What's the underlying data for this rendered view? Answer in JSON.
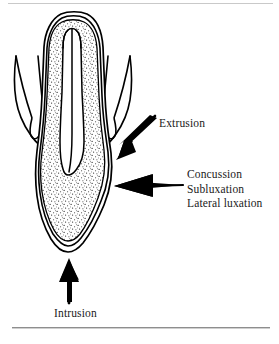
{
  "figure": {
    "orientation": "inverted-root-up-crown-down",
    "structures": [
      {
        "name": "root",
        "fill": "stippled-dentin"
      },
      {
        "name": "pulp-canal",
        "fill": "white"
      },
      {
        "name": "enamel-outline",
        "fill": "white"
      },
      {
        "name": "gingiva",
        "fill": "white"
      },
      {
        "name": "periodontal-ligament",
        "fill": "white"
      }
    ],
    "colors": {
      "ink": "#000000",
      "paper": "#ffffff",
      "stipple": "#333333",
      "rule": "#8e8e8e"
    }
  },
  "labels": {
    "extrusion": "Extrusion",
    "concussion": "Concussion",
    "subluxation": "Subluxation",
    "lateral_luxation": "Lateral luxation",
    "intrusion": "Intrusion"
  },
  "arrows": [
    {
      "name": "extrusion-arrow",
      "direction": "down-left",
      "points_to": "cervical-region",
      "label": "Extrusion"
    },
    {
      "name": "lateral-arrow",
      "direction": "left",
      "points_to": "crown-mid-facial",
      "label": "Concussion / Subluxation / Lateral luxation"
    },
    {
      "name": "intrusion-arrow",
      "direction": "up",
      "points_to": "crown-apex",
      "label": "Intrusion"
    }
  ]
}
